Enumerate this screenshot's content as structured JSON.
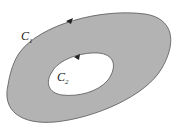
{
  "diagram": {
    "region_fill": "#b3b3b3",
    "stroke": "#555555",
    "outer_curve": {
      "label": "C",
      "subscript": "1"
    },
    "inner_curve": {
      "label": "C",
      "subscript": "2"
    }
  }
}
